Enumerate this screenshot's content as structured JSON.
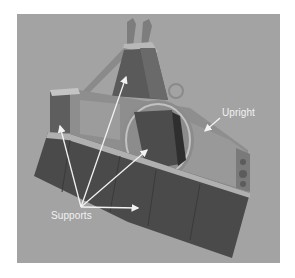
{
  "figure": {
    "background_color": "#a3a3a3",
    "part_dark_color": "#4a4a4a",
    "part_light_color": "#8e8e8e",
    "annotation_color": "#f2f2f2"
  },
  "labels": {
    "upright": "Upright",
    "supports": "Supports"
  },
  "callouts": {
    "upright": {
      "label_pos": [
        222,
        112
      ],
      "arrow_tip": [
        203,
        132
      ]
    },
    "supports": {
      "origin": [
        81,
        207
      ],
      "arrow_tips": [
        [
          59,
          124
        ],
        [
          126,
          75
        ],
        [
          148,
          149
        ],
        [
          139,
          208
        ]
      ]
    }
  }
}
